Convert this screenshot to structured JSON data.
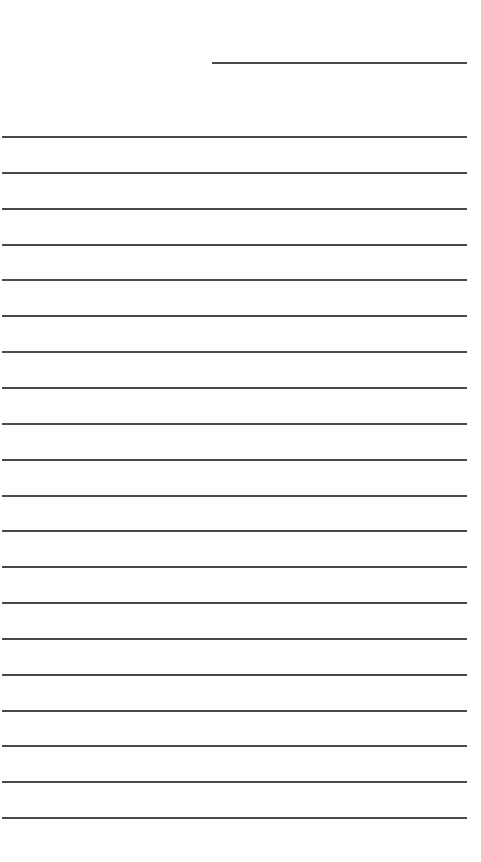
{
  "page": {
    "type": "lined-paper",
    "background": "#ffffff",
    "line_color": "#4a4a4a",
    "header_line": {
      "x1": 212,
      "x2": 467,
      "y": 62
    },
    "ruled_lines": {
      "count": 20,
      "x1": 2,
      "x2": 467,
      "y_start": 136,
      "spacing": 35.85
    }
  }
}
